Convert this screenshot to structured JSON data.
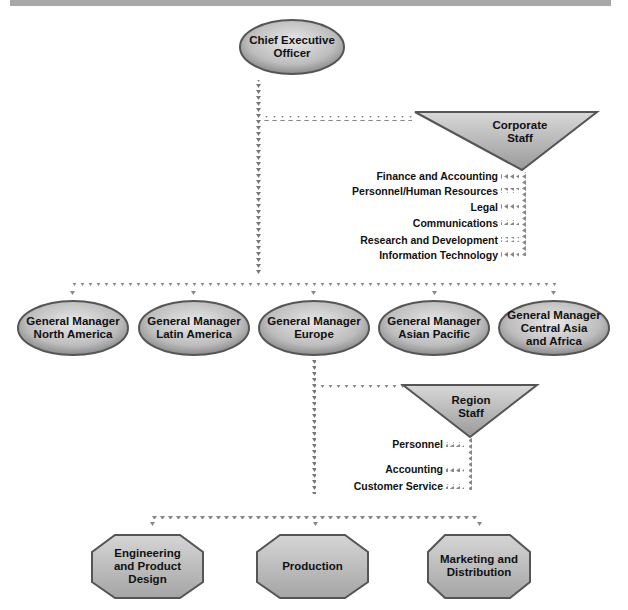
{
  "diagram": {
    "type": "organizational-chart",
    "ceo": {
      "line1": "Chief Executive",
      "line2": "Officer"
    },
    "corporate_staff": {
      "line1": "Corporate",
      "line2": "Staff",
      "functions": [
        "Finance and Accounting",
        "Personnel/Human Resources",
        "Legal",
        "Communications",
        "Research and Development",
        "Information Technology"
      ]
    },
    "general_managers": [
      {
        "line1": "General Manager",
        "line2": "North America",
        "line3": ""
      },
      {
        "line1": "General Manager",
        "line2": "Latin America",
        "line3": ""
      },
      {
        "line1": "General Manager",
        "line2": "Europe",
        "line3": ""
      },
      {
        "line1": "General Manager",
        "line2": "Asian Pacific",
        "line3": ""
      },
      {
        "line1": "General Manager",
        "line2": "Central Asia",
        "line3": "and Africa"
      }
    ],
    "region_staff": {
      "line1": "Region",
      "line2": "Staff",
      "functions": [
        "Personnel",
        "Accounting",
        "Customer Service"
      ]
    },
    "departments": [
      {
        "line1": "Engineering",
        "line2": "and Product",
        "line3": "Design"
      },
      {
        "line1": "Production",
        "line2": "",
        "line3": ""
      },
      {
        "line1": "Marketing and",
        "line2": "Distribution",
        "line3": ""
      }
    ],
    "colors": {
      "shape_fill": "#bdbdbd",
      "shape_border": "#555555",
      "connector": "#7a7a7a",
      "top_bar": "#a8a8a8"
    }
  }
}
